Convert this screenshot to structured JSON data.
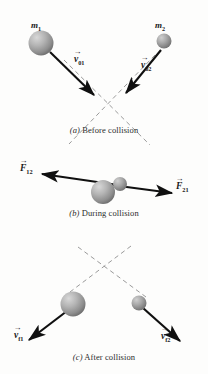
{
  "figure": {
    "background": "#fdfdfc",
    "width": 208,
    "height": 374
  },
  "style": {
    "ball_fill_light": "#c9c9c9",
    "ball_fill_mid": "#9d9d9d",
    "ball_fill_dark": "#6f6f6f",
    "arrow_color": "#101010",
    "dash_color": "#9a9a9a",
    "text_color": "#1a1a1a",
    "caption_color": "#2b2b2b"
  },
  "panels": [
    {
      "id": "a",
      "caption_index": "(a)",
      "caption_text": "Before collision",
      "balls": [
        {
          "name": "mass-1",
          "label": "m",
          "sub": "1",
          "cx": 41,
          "cy": 43,
          "r": 12.5
        },
        {
          "name": "mass-2",
          "label": "m",
          "sub": "2",
          "cx": 164,
          "cy": 41,
          "r": 7.5
        }
      ],
      "vectors": [
        {
          "name": "velocity-v01",
          "symbol": "v",
          "sub": "01",
          "kind": "velocity"
        },
        {
          "name": "velocity-v02",
          "symbol": "v",
          "sub": "02",
          "kind": "velocity"
        }
      ],
      "crossing_point": {
        "x": 108,
        "y": 106
      }
    },
    {
      "id": "b",
      "caption_index": "(b)",
      "caption_text": "During collision",
      "balls": [
        {
          "name": "mass-1",
          "label": "",
          "sub": "",
          "cx": 103,
          "cy": 192,
          "r": 12
        },
        {
          "name": "mass-2",
          "label": "",
          "sub": "",
          "cx": 120,
          "cy": 184,
          "r": 7
        }
      ],
      "vectors": [
        {
          "name": "force-F12",
          "symbol": "F",
          "sub": "12",
          "kind": "force"
        },
        {
          "name": "force-F21",
          "symbol": "F",
          "sub": "21",
          "kind": "force"
        }
      ]
    },
    {
      "id": "c",
      "caption_index": "(c)",
      "caption_text": "After collision",
      "balls": [
        {
          "name": "mass-1",
          "label": "",
          "sub": "",
          "cx": 73,
          "cy": 304,
          "r": 12.5
        },
        {
          "name": "mass-2",
          "label": "",
          "sub": "",
          "cx": 139,
          "cy": 303,
          "r": 7.5
        }
      ],
      "vectors": [
        {
          "name": "velocity-vf1",
          "symbol": "v",
          "sub": "f1",
          "kind": "velocity"
        },
        {
          "name": "velocity-vf2",
          "symbol": "v",
          "sub": "f2",
          "kind": "velocity"
        }
      ],
      "crossing_point": {
        "x": 104,
        "y": 272
      }
    }
  ],
  "labels": {
    "m1": {
      "sym": "m",
      "sub": "1"
    },
    "m2": {
      "sym": "m",
      "sub": "2"
    },
    "v01": {
      "sym": "v",
      "sub": "01"
    },
    "v02": {
      "sym": "v",
      "sub": "02"
    },
    "F12": {
      "sym": "F",
      "sub": "12"
    },
    "F21": {
      "sym": "F",
      "sub": "21"
    },
    "vf1": {
      "sym": "v",
      "sub": "f1"
    },
    "vf2": {
      "sym": "v",
      "sub": "f2"
    },
    "vector_arrow": "→"
  },
  "captions": {
    "a_index": "(a)",
    "a_text": "Before collision",
    "b_index": "(b)",
    "b_text": "During collision",
    "c_index": "(c)",
    "c_text": "After collision"
  }
}
